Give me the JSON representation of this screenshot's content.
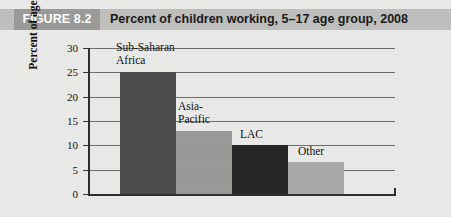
{
  "figure": {
    "tag": "FIGURE 8.2",
    "title": "Percent of children working, 5–17 age group, 2008"
  },
  "chart_data": {
    "type": "bar",
    "title": "Percent of children working, 5–17 age group, 2008",
    "xlabel": "",
    "ylabel": "Percent of age group 5–17",
    "ylim": [
      0,
      30
    ],
    "ytick_values": [
      0,
      5,
      10,
      15,
      20,
      25,
      30
    ],
    "ytick_labels": [
      "0",
      "5",
      "10",
      "15",
      "20",
      "25",
      "30"
    ],
    "grid": true,
    "legend": "none",
    "categories": [
      "Sub-Saharan Africa",
      "Asia-Pacific",
      "LAC",
      "Other"
    ],
    "values": [
      25.0,
      13.0,
      10.0,
      6.5
    ],
    "bar_colors": [
      "#4d4d4d",
      "#999997",
      "#262626",
      "#a9a9a7"
    ],
    "labels": [
      {
        "text": "Sub-Saharan\nAfrica",
        "category": "Sub-Saharan Africa"
      },
      {
        "text": "Asia-\nPacific",
        "category": "Asia-Pacific"
      },
      {
        "text": "LAC",
        "category": "LAC"
      },
      {
        "text": "Other",
        "category": "Other"
      }
    ]
  },
  "colors": {
    "page_background": "#e9e9e7",
    "title_band": "#bfbfbd",
    "tag_box": "#9a9a98",
    "tag_text": "#ffffff",
    "axis": "#2f2f2f",
    "gridline": "#6e6e6e"
  }
}
